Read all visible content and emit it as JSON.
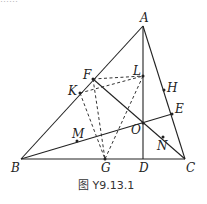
{
  "top_clipped_text": "……",
  "figure": {
    "caption": "图 Y9.13.1",
    "points": {
      "A": {
        "label": "A",
        "x": 143,
        "y": 26
      },
      "B": {
        "label": "B",
        "x": 21,
        "y": 159
      },
      "C": {
        "label": "C",
        "x": 185,
        "y": 159
      },
      "D": {
        "label": "D",
        "x": 143,
        "y": 159
      },
      "E": {
        "label": "E",
        "x": 172,
        "y": 114
      },
      "F": {
        "label": "F",
        "x": 93,
        "y": 79
      },
      "G": {
        "label": "G",
        "x": 105,
        "y": 159
      },
      "H": {
        "label": "H",
        "x": 164,
        "y": 90
      },
      "K": {
        "label": "K",
        "x": 80,
        "y": 93
      },
      "L": {
        "label": "L",
        "x": 143,
        "y": 76
      },
      "M": {
        "label": "M",
        "x": 77,
        "y": 141
      },
      "N": {
        "label": "N",
        "x": 163,
        "y": 137
      },
      "O": {
        "label": "O",
        "x": 143,
        "y": 123
      }
    },
    "solid_segments": [
      [
        "A",
        "B"
      ],
      [
        "B",
        "C"
      ],
      [
        "C",
        "A"
      ],
      [
        "A",
        "D"
      ],
      [
        "F",
        "C"
      ],
      [
        "B",
        "E"
      ]
    ],
    "dashed_segments": [
      [
        "F",
        "L"
      ],
      [
        "K",
        "L"
      ],
      [
        "F",
        "G"
      ],
      [
        "K",
        "G"
      ],
      [
        "L",
        "G"
      ]
    ]
  }
}
